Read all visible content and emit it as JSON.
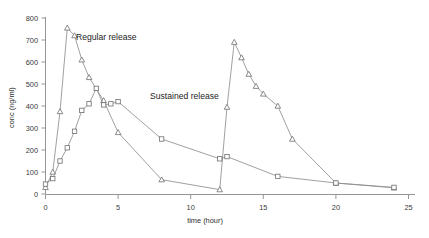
{
  "chart_data": {
    "type": "line",
    "title": "",
    "xlabel": "time (hour)",
    "ylabel": "conc (ng/ml)",
    "xlim": [
      0,
      25
    ],
    "ylim": [
      0,
      800
    ],
    "xticks": [
      0,
      5,
      10,
      15,
      20,
      25
    ],
    "yticks": [
      0,
      100,
      200,
      300,
      400,
      500,
      600,
      700,
      800
    ],
    "grid": false,
    "legend_position": "inline-annotations",
    "series": [
      {
        "name": "Regular release",
        "marker": "triangle",
        "x": [
          0,
          0.5,
          1,
          1.5,
          2,
          2.5,
          3,
          4,
          5,
          8,
          12,
          12.5,
          13,
          13.5,
          14,
          14.5,
          15,
          16,
          17,
          20,
          24
        ],
        "values": [
          30,
          100,
          375,
          755,
          720,
          610,
          530,
          425,
          280,
          65,
          20,
          395,
          690,
          620,
          545,
          490,
          455,
          400,
          250,
          50,
          28
        ]
      },
      {
        "name": "Sustained release",
        "marker": "square",
        "x": [
          0,
          0.5,
          1,
          1.5,
          2,
          2.5,
          3,
          3.5,
          4,
          4.5,
          5,
          8,
          12,
          12.5,
          16,
          20,
          24
        ],
        "values": [
          45,
          70,
          150,
          210,
          285,
          380,
          410,
          480,
          405,
          410,
          420,
          250,
          160,
          170,
          80,
          50,
          30
        ]
      }
    ],
    "annotations": [
      {
        "text": "Regular release",
        "x": 2.1,
        "y": 700
      },
      {
        "text": "Sustained release",
        "x": 7.2,
        "y": 430
      }
    ]
  },
  "axis": {
    "x_title": "time (hour)",
    "y_title": "conc (ng/ml)",
    "x_tick_labels": [
      "0",
      "5",
      "10",
      "15",
      "20",
      "25"
    ],
    "y_tick_labels": [
      "0",
      "100",
      "200",
      "300",
      "400",
      "500",
      "600",
      "700",
      "800"
    ]
  },
  "colors": {
    "line": "#8f8f8f",
    "axis": "#8a8a8a",
    "text": "#2e2e2e",
    "background": "#ffffff"
  }
}
